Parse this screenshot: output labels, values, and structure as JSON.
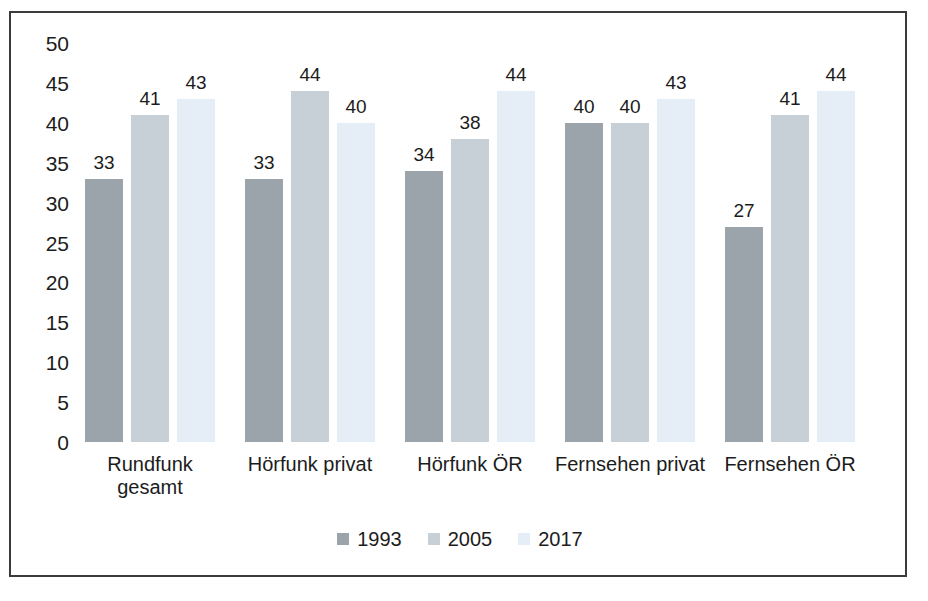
{
  "chart_data": {
    "type": "bar",
    "title": "",
    "subtitle": "",
    "xlabel": "",
    "ylabel": "",
    "ylim": [
      0,
      50
    ],
    "yticks": [
      50,
      45,
      40,
      35,
      30,
      25,
      20,
      15,
      10,
      5,
      0
    ],
    "grid": false,
    "legend_position": "bottom",
    "categories": [
      "Rundfunk\ngesamt",
      "Hörfunk privat",
      "Hörfunk ÖR",
      "Fernsehen privat",
      "Fernsehen ÖR"
    ],
    "series": [
      {
        "name": "1993",
        "color": "#9ba4aa",
        "values": [
          33,
          33,
          34,
          40,
          27
        ]
      },
      {
        "name": "2005",
        "color": "#c6d0d6",
        "values": [
          41,
          44,
          38,
          40,
          41
        ]
      },
      {
        "name": "2017",
        "color": "#e5eef7",
        "values": [
          43,
          40,
          44,
          43,
          44
        ]
      }
    ]
  },
  "colors": {
    "frame_border": "#3b3b3b",
    "text": "#1c1c1c",
    "background": "#ffffff"
  }
}
